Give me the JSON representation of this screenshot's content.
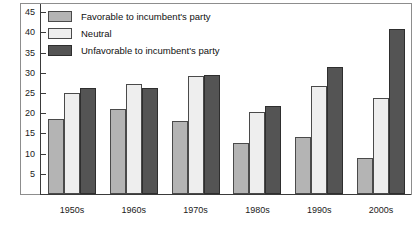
{
  "chart_data": {
    "type": "bar",
    "title": "",
    "subtitle": "",
    "xlabel": "",
    "ylabel": "",
    "categories": [
      "1950s",
      "1960s",
      "1970s",
      "1980s",
      "1990s",
      "2000s"
    ],
    "series": [
      {
        "name": "Favorable to incumbent's party",
        "color": "#b4b4b4",
        "values": [
          18.5,
          21,
          18,
          12.5,
          14,
          9
        ]
      },
      {
        "name": "Neutral",
        "color": "#eeeeee",
        "values": [
          25,
          27.3,
          29.3,
          20.4,
          26.7,
          23.7
        ]
      },
      {
        "name": "Unfavorable to incumbent's party",
        "color": "#545454",
        "values": [
          26.3,
          26.2,
          29.4,
          21.8,
          31.5,
          40.7
        ]
      }
    ],
    "ylim": [
      0,
      47
    ],
    "yticks": [
      5,
      10,
      15,
      20,
      25,
      30,
      35,
      40,
      45
    ],
    "ytick_labels": [
      "5",
      "10",
      "15",
      "20",
      "25",
      "30",
      "35",
      "40",
      "45"
    ],
    "grid": false,
    "legend_position": "top-left"
  },
  "legend": {
    "items": [
      {
        "label": "Favorable to incumbent's party"
      },
      {
        "label": "Neutral"
      },
      {
        "label": "Unfavorable to incumbent's party"
      }
    ]
  }
}
